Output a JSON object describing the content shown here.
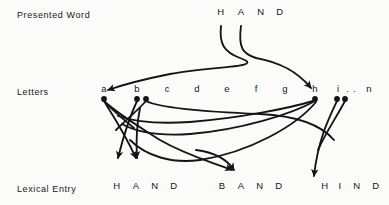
{
  "figure": {
    "background_color": "#fbfbf9",
    "ink_color": "#141417",
    "width": 389,
    "height": 205
  },
  "rows": {
    "presented_word": {
      "label": "Presented Word",
      "y": 16
    },
    "letters": {
      "label": "Letters",
      "y": 93
    },
    "lexical_entry": {
      "label": "Lexical Entry",
      "y": 190
    }
  },
  "presented_word": {
    "text": "HAND",
    "letters": [
      {
        "char": "H",
        "x": 221
      },
      {
        "char": "A",
        "x": 241
      },
      {
        "char": "N",
        "x": 261
      },
      {
        "char": "D",
        "x": 280
      }
    ]
  },
  "letter_nodes": [
    {
      "char": "a",
      "x": 104
    },
    {
      "char": "b",
      "x": 137
    },
    {
      "char": "c",
      "x": 167
    },
    {
      "char": "d",
      "x": 197
    },
    {
      "char": "e",
      "x": 227
    },
    {
      "char": "f",
      "x": 256
    },
    {
      "char": "g",
      "x": 285
    },
    {
      "char": "h",
      "x": 315
    },
    {
      "char": "i",
      "x": 338
    },
    {
      "char": ".",
      "x": 348
    },
    {
      "char": ".",
      "x": 355
    },
    {
      "char": "n",
      "x": 369
    }
  ],
  "lexical_entries": [
    {
      "word": "HAND",
      "letters": [
        {
          "char": "H",
          "x": 117
        },
        {
          "char": "A",
          "x": 136
        },
        {
          "char": "N",
          "x": 155
        },
        {
          "char": "D",
          "x": 174
        }
      ]
    },
    {
      "word": "BAND",
      "letters": [
        {
          "char": "B",
          "x": 222
        },
        {
          "char": "A",
          "x": 241
        },
        {
          "char": "N",
          "x": 260
        },
        {
          "char": "D",
          "x": 279
        }
      ]
    },
    {
      "word": "HIND",
      "letters": [
        {
          "char": "H",
          "x": 325
        },
        {
          "char": "I",
          "x": 340
        },
        {
          "char": "N",
          "x": 357
        },
        {
          "char": "D",
          "x": 376
        }
      ]
    }
  ],
  "connections": {
    "word_to_letters": [
      {
        "from": "H",
        "to": "a",
        "description": "curve from presented H sweeping left to letter node a"
      },
      {
        "from": "A",
        "to": "h",
        "description": "curve from presented A sweeping right to letter node h"
      }
    ],
    "letters_to_entries": [
      {
        "from": "a",
        "to": "HAND-A"
      },
      {
        "from": "a",
        "to": "BAND-A"
      },
      {
        "from": "b",
        "to": "HAND-H"
      },
      {
        "from": "b",
        "to": "HAND-A"
      },
      {
        "from": "h",
        "to": "HAND-H"
      },
      {
        "from": "h",
        "to": "HAND-A"
      },
      {
        "from": "h",
        "to": "HIND-H"
      },
      {
        "from": "i",
        "to": "HIND-I"
      },
      {
        "from": "i",
        "to": "HAND-H"
      }
    ]
  }
}
